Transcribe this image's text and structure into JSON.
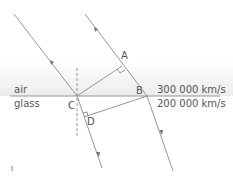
{
  "diagram": {
    "media": {
      "upper": "air",
      "lower": "glass"
    },
    "speeds": {
      "air": "300 000 km/s",
      "glass": "200 000 km/s"
    },
    "points": {
      "A": "A",
      "B": "B",
      "C": "C",
      "D": "D"
    },
    "footnote": "I",
    "colors": {
      "line": "#8a8a8a",
      "text": "#555555",
      "air_band": "#ececec"
    }
  }
}
